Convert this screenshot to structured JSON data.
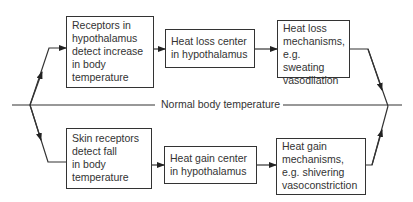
{
  "diagram": {
    "type": "flowchart",
    "title": "",
    "midline_label": "Normal body temperature",
    "upper_path": {
      "boxes": [
        {
          "id": "receptors-hypothalamus",
          "text": "Receptors in\nhypothalamus\ndetect increase\nin body\ntemperature"
        },
        {
          "id": "heat-loss-center",
          "text": "Heat loss center\nin hypothalamus"
        },
        {
          "id": "heat-loss-mechanisms",
          "text": "Heat loss\nmechanisms,\ne.g. sweating\nvasodilation"
        }
      ]
    },
    "lower_path": {
      "boxes": [
        {
          "id": "skin-receptors",
          "text": "Skin receptors\ndetect fall\nin body\ntemperature"
        },
        {
          "id": "heat-gain-center",
          "text": "Heat gain center\nin hypothalamus"
        },
        {
          "id": "heat-gain-mechanisms",
          "text": "Heat gain\nmechanisms,\ne.g. shivering\nvasoconstriction"
        }
      ]
    },
    "colors": {
      "line": "#333333",
      "background": "#ffffff"
    }
  }
}
